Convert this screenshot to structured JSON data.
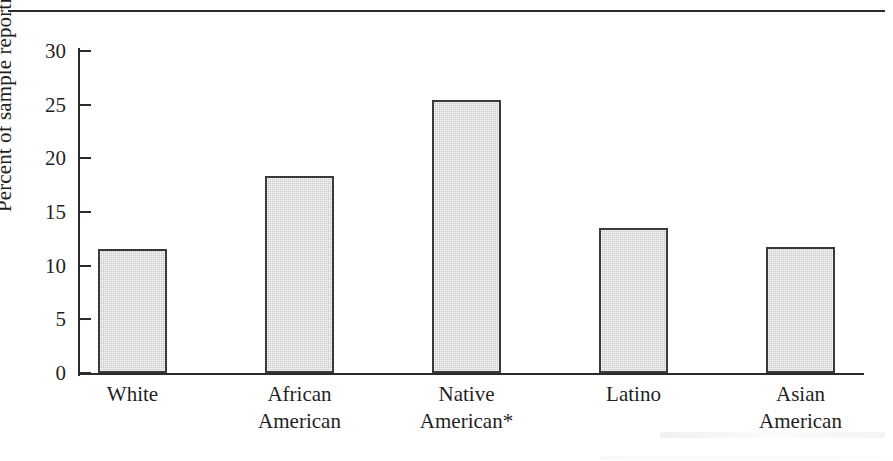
{
  "chart_data": {
    "type": "bar",
    "title": "",
    "xlabel": "",
    "ylabel": "Percent of sample reporting",
    "ylim": [
      0,
      30
    ],
    "yticks": [
      0,
      5,
      10,
      15,
      20,
      25,
      30
    ],
    "ytick_labels": [
      "0",
      "5",
      "10",
      "15",
      "20",
      "25",
      "30"
    ],
    "grid": false,
    "legend": "none",
    "categories": [
      "White",
      "African American",
      "Native American*",
      "Latino",
      "Asian American"
    ],
    "category_lines": [
      [
        "White",
        ""
      ],
      [
        "African",
        "American"
      ],
      [
        "Native",
        "American*"
      ],
      [
        "Latino",
        ""
      ],
      [
        "Asian",
        "American"
      ]
    ],
    "values": [
      11.6,
      18.4,
      25.4,
      13.5,
      11.7
    ],
    "bar_fill_color": "#c9c9c9",
    "bar_border_color": "#3a3a3a",
    "axis_color": "#2b2b2b",
    "footnote_marker": "*"
  }
}
